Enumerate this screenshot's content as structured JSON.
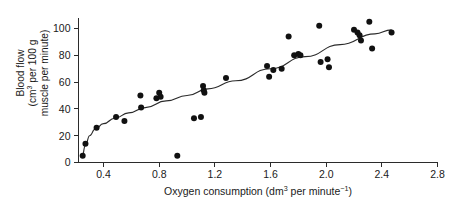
{
  "chart_data": {
    "type": "scatter",
    "title": "",
    "xlabel": "Oxygen consumption (dm3 per minute-1)",
    "xlabel_parts": {
      "main": "Oxygen consumption (dm",
      "sup1": "3",
      "mid": " per minute",
      "sup2": "−1",
      "end": ")"
    },
    "ylabel": "Blood flow (cm3 per 100 g muscle per minute)",
    "ylabel_lines": [
      {
        "text": "Blood flow",
        "sup": "",
        "after": ""
      },
      {
        "text": "(cm",
        "sup": "3",
        "after": " per 100 g"
      },
      {
        "text": "muscle per minute)",
        "sup": "",
        "after": ""
      }
    ],
    "xlim": [
      0.22,
      2.8
    ],
    "ylim": [
      0,
      108
    ],
    "xticks": [
      0.4,
      0.8,
      1.2,
      1.6,
      2.0,
      2.4,
      2.8
    ],
    "xtick_labels": [
      "0.4",
      "0.8",
      "1.2",
      "1.6",
      "2.0",
      "2.4",
      "2.8"
    ],
    "yticks": [
      0,
      20,
      40,
      60,
      80,
      100
    ],
    "ytick_labels": [
      "0",
      "20",
      "40",
      "60",
      "80",
      "100"
    ],
    "grid": false,
    "legend": false,
    "point_color": "#111111",
    "line_color": "#2b2b2b",
    "axis_color": "#2b2b2b",
    "points": [
      {
        "x": 0.25,
        "y": 5
      },
      {
        "x": 0.27,
        "y": 14
      },
      {
        "x": 0.35,
        "y": 26
      },
      {
        "x": 0.49,
        "y": 34
      },
      {
        "x": 0.55,
        "y": 31
      },
      {
        "x": 0.665,
        "y": 50
      },
      {
        "x": 0.67,
        "y": 41
      },
      {
        "x": 0.78,
        "y": 48
      },
      {
        "x": 0.8,
        "y": 52
      },
      {
        "x": 0.81,
        "y": 49
      },
      {
        "x": 0.93,
        "y": 5
      },
      {
        "x": 1.05,
        "y": 33
      },
      {
        "x": 1.1,
        "y": 34
      },
      {
        "x": 1.115,
        "y": 57
      },
      {
        "x": 1.12,
        "y": 54
      },
      {
        "x": 1.125,
        "y": 52
      },
      {
        "x": 1.28,
        "y": 63
      },
      {
        "x": 1.575,
        "y": 72
      },
      {
        "x": 1.59,
        "y": 64
      },
      {
        "x": 1.62,
        "y": 69
      },
      {
        "x": 1.68,
        "y": 70
      },
      {
        "x": 1.73,
        "y": 94
      },
      {
        "x": 1.77,
        "y": 80
      },
      {
        "x": 1.8,
        "y": 81
      },
      {
        "x": 1.815,
        "y": 80
      },
      {
        "x": 1.95,
        "y": 102
      },
      {
        "x": 1.96,
        "y": 75
      },
      {
        "x": 2.01,
        "y": 77
      },
      {
        "x": 2.02,
        "y": 71
      },
      {
        "x": 2.2,
        "y": 99
      },
      {
        "x": 2.225,
        "y": 97
      },
      {
        "x": 2.24,
        "y": 95
      },
      {
        "x": 2.25,
        "y": 91
      },
      {
        "x": 2.31,
        "y": 105
      },
      {
        "x": 2.33,
        "y": 85
      },
      {
        "x": 2.47,
        "y": 97
      }
    ],
    "trend_line": [
      {
        "x": 0.245,
        "y": 4
      },
      {
        "x": 0.27,
        "y": 13
      },
      {
        "x": 0.3,
        "y": 20
      },
      {
        "x": 0.34,
        "y": 25
      },
      {
        "x": 0.4,
        "y": 29
      },
      {
        "x": 0.48,
        "y": 33
      },
      {
        "x": 0.58,
        "y": 37
      },
      {
        "x": 0.7,
        "y": 41
      },
      {
        "x": 0.85,
        "y": 46
      },
      {
        "x": 1.0,
        "y": 50
      },
      {
        "x": 1.15,
        "y": 55
      },
      {
        "x": 1.35,
        "y": 61
      },
      {
        "x": 1.6,
        "y": 70
      },
      {
        "x": 1.85,
        "y": 79
      },
      {
        "x": 2.1,
        "y": 88
      },
      {
        "x": 2.35,
        "y": 96
      },
      {
        "x": 2.47,
        "y": 99
      }
    ]
  }
}
